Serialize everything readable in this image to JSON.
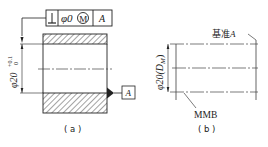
{
  "figure_a": {
    "feature_control_frame": {
      "symbol": "⊥",
      "symbol_name": "perpendicularity",
      "tolerance": "φ0",
      "modifier": "M",
      "datum": "A"
    },
    "dimension": {
      "nominal": "φ20",
      "upper_dev": "+0.1",
      "lower_dev": "0"
    },
    "datum_label": "A",
    "caption": "( a )"
  },
  "figure_b": {
    "dimension": "φ20(D",
    "dimension_sub": "M",
    "dimension_close": ")",
    "datum_label_prefix": "基准",
    "datum_label_letter": "A",
    "boundary_label": "MMB",
    "caption": "( b )"
  }
}
